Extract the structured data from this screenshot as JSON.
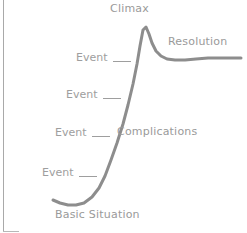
{
  "diagram": {
    "curve_color": "#8d8d8d",
    "text_color": "#9a9a9a",
    "background": "#ffffff"
  },
  "labels": {
    "climax": "Climax",
    "resolution": "Resolution",
    "complications": "Complications",
    "basic_situation": "Basic Situation"
  },
  "events": [
    {
      "label": "Event"
    },
    {
      "label": "Event"
    },
    {
      "label": "Event"
    },
    {
      "label": "Event"
    }
  ],
  "chart_data": {
    "type": "line",
    "xlabel": "",
    "ylabel": "",
    "grid": false,
    "legend": "none",
    "xlim": [
      0,
      247
    ],
    "ylim": [
      233,
      0
    ],
    "annotations": [
      {
        "text": "Climax",
        "x": 143,
        "y": 12
      },
      {
        "text": "Resolution",
        "x": 198,
        "y": 44
      },
      {
        "text": "Complications",
        "x": 160,
        "y": 132
      },
      {
        "text": "Basic Situation",
        "x": 100,
        "y": 216
      },
      {
        "text": "Event",
        "x": 90,
        "y": 58
      },
      {
        "text": "Event",
        "x": 80,
        "y": 95
      },
      {
        "text": "Event",
        "x": 69,
        "y": 133
      },
      {
        "text": "Event",
        "x": 56,
        "y": 173
      }
    ],
    "series": [
      {
        "name": "story arc",
        "points": [
          [
            53,
            200
          ],
          [
            60,
            203
          ],
          [
            68,
            205
          ],
          [
            76,
            205
          ],
          [
            84,
            203
          ],
          [
            92,
            197
          ],
          [
            99,
            188
          ],
          [
            105,
            176
          ],
          [
            111,
            160
          ],
          [
            117,
            143
          ],
          [
            123,
            124
          ],
          [
            128,
            105
          ],
          [
            133,
            84
          ],
          [
            137,
            64
          ],
          [
            140,
            46
          ],
          [
            143,
            30
          ],
          [
            146,
            27
          ],
          [
            149,
            34
          ],
          [
            152,
            43
          ],
          [
            156,
            51
          ],
          [
            161,
            56
          ],
          [
            167,
            59
          ],
          [
            175,
            60
          ],
          [
            185,
            60
          ],
          [
            196,
            59
          ],
          [
            208,
            58
          ],
          [
            220,
            58
          ],
          [
            232,
            58
          ],
          [
            241,
            58
          ]
        ]
      }
    ]
  }
}
